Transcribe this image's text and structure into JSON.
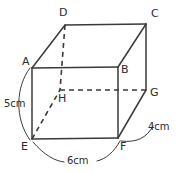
{
  "figure": {
    "stroke_color": "#3a3a3a",
    "text_color": "#2b2b2b",
    "background_color": "#ffffff",
    "vertices": [
      {
        "id": "A",
        "label": "A",
        "x": 32,
        "y": 68,
        "label_x": 22,
        "label_y": 65
      },
      {
        "id": "B",
        "label": "B",
        "x": 118,
        "y": 67,
        "label_x": 121,
        "label_y": 73
      },
      {
        "id": "C",
        "label": "C",
        "x": 146,
        "y": 24,
        "label_x": 151,
        "label_y": 17
      },
      {
        "id": "D",
        "label": "D",
        "x": 65,
        "y": 25,
        "label_x": 59,
        "label_y": 16
      },
      {
        "id": "E",
        "label": "E",
        "x": 32,
        "y": 139,
        "label_x": 21,
        "label_y": 150
      },
      {
        "id": "F",
        "label": "F",
        "x": 118,
        "y": 138,
        "label_x": 120,
        "label_y": 150
      },
      {
        "id": "G",
        "label": "G",
        "x": 146,
        "y": 90,
        "label_x": 150,
        "label_y": 96
      },
      {
        "id": "H",
        "label": "H",
        "x": 60,
        "y": 90,
        "label_x": 58,
        "label_y": 102
      }
    ],
    "solid_edges": [
      {
        "name": "edge-A-B",
        "from": "A",
        "to": "B"
      },
      {
        "name": "edge-B-F",
        "from": "B",
        "to": "F"
      },
      {
        "name": "edge-F-E",
        "from": "F",
        "to": "E"
      },
      {
        "name": "edge-E-A",
        "from": "E",
        "to": "A"
      },
      {
        "name": "edge-D-C",
        "from": "D",
        "to": "C"
      },
      {
        "name": "edge-C-G",
        "from": "C",
        "to": "G"
      },
      {
        "name": "edge-A-D",
        "from": "A",
        "to": "D"
      },
      {
        "name": "edge-B-C",
        "from": "B",
        "to": "C"
      },
      {
        "name": "edge-F-G",
        "from": "F",
        "to": "G"
      }
    ],
    "dashed_edges": [
      {
        "name": "edge-D-H",
        "from": "D",
        "to": "H"
      },
      {
        "name": "edge-H-G",
        "from": "H",
        "to": "G"
      },
      {
        "name": "edge-E-H",
        "from": "E",
        "to": "H"
      }
    ],
    "measurements": [
      {
        "name": "measurement-height-5cm",
        "text": "5cm",
        "text_x": 4,
        "text_y": 107,
        "arc": "M 30 68 C 16 86, 14 118, 30 140"
      },
      {
        "name": "measurement-width-6cm",
        "text": "6cm",
        "text_x": 67,
        "text_y": 164,
        "arc_left": "M 33 142 C 44 155, 55 161, 64 162",
        "arc_right": "M 97 161 C 106 159, 114 152, 120 141"
      },
      {
        "name": "measurement-depth-4cm",
        "text": "4cm",
        "text_x": 148,
        "text_y": 130,
        "arc": "M 121 141 C 136 143, 147 138, 153 126"
      }
    ]
  }
}
